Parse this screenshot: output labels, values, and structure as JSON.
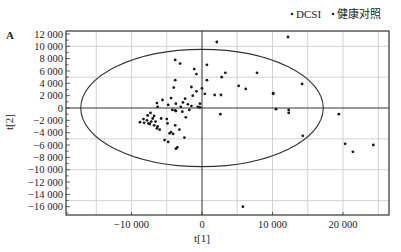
{
  "chart_data": {
    "type": "scatter",
    "panel_label": "A",
    "title": "",
    "xlabel": "t[1]",
    "ylabel": "t[2]",
    "xlim": [
      -19000,
      26500
    ],
    "ylim": [
      -17200,
      12500
    ],
    "x_ticks": [
      {
        "value": -10000,
        "label": "−10 000"
      },
      {
        "value": 0,
        "label": "0"
      },
      {
        "value": 10000,
        "label": "10 000"
      },
      {
        "value": 20000,
        "label": "20 000"
      }
    ],
    "y_ticks": [
      {
        "value": 12000,
        "label": "12 000"
      },
      {
        "value": 10000,
        "label": "10 000"
      },
      {
        "value": 8000,
        "label": "8 000"
      },
      {
        "value": 6000,
        "label": "6 000"
      },
      {
        "value": 4000,
        "label": "4 000"
      },
      {
        "value": 2000,
        "label": "2 000"
      },
      {
        "value": 0,
        "label": "0"
      },
      {
        "value": -2000,
        "label": "−2 000"
      },
      {
        "value": -4000,
        "label": "−4 000"
      },
      {
        "value": -6000,
        "label": "−6 000"
      },
      {
        "value": -8000,
        "label": "−8 000"
      },
      {
        "value": -10000,
        "label": "−10 000"
      },
      {
        "value": -12000,
        "label": "−12 000"
      },
      {
        "value": -14000,
        "label": "−14 000"
      },
      {
        "value": -16000,
        "label": "−16 000"
      }
    ],
    "grid": {
      "on": true,
      "x_step": 5000,
      "y_step": 5000
    },
    "legend": {
      "position": "top-right",
      "entries": [
        {
          "name": "DCSI",
          "marker": "dot"
        },
        {
          "name": "健康对照",
          "marker": "dot"
        }
      ]
    },
    "ellipse": {
      "label": "Hotelling T2 95%",
      "cx": 0,
      "cy": 0,
      "rx": 17200,
      "ry": 9500
    },
    "series": [
      {
        "name": "DCSI",
        "points": [
          [
            2100,
            10700
          ],
          [
            12200,
            11500
          ],
          [
            700,
            7000
          ],
          [
            3300,
            5700
          ],
          [
            7800,
            5700
          ],
          [
            700,
            4500
          ],
          [
            2800,
            5000
          ],
          [
            0,
            3200
          ],
          [
            5200,
            3600
          ],
          [
            6200,
            3100
          ],
          [
            10100,
            2400
          ],
          [
            14200,
            3900
          ],
          [
            400,
            2300
          ],
          [
            1800,
            2100
          ],
          [
            2700,
            2100
          ],
          [
            10100,
            2300
          ],
          [
            10500,
            -200
          ],
          [
            12300,
            -300
          ],
          [
            12300,
            -800
          ],
          [
            2600,
            -1000
          ],
          [
            19400,
            -1000
          ],
          [
            14300,
            -4500
          ],
          [
            20300,
            -5800
          ],
          [
            21400,
            -7100
          ],
          [
            24300,
            -6000
          ],
          [
            5800,
            -16000
          ]
        ]
      },
      {
        "name": "健康对照",
        "points": [
          [
            -3800,
            7800
          ],
          [
            -3100,
            7200
          ],
          [
            -1100,
            6300
          ],
          [
            -800,
            5500
          ],
          [
            -3800,
            4500
          ],
          [
            -4000,
            3300
          ],
          [
            -1500,
            3400
          ],
          [
            -2400,
            1500
          ],
          [
            -800,
            2700
          ],
          [
            -1300,
            2000
          ],
          [
            -2700,
            900
          ],
          [
            -3700,
            700
          ],
          [
            -4800,
            500
          ],
          [
            -2000,
            600
          ],
          [
            -1500,
            300
          ],
          [
            -3000,
            200
          ],
          [
            -600,
            200
          ],
          [
            -300,
            100
          ],
          [
            -4200,
            -300
          ],
          [
            -3700,
            -500
          ],
          [
            -6300,
            200
          ],
          [
            -7300,
            -800
          ],
          [
            -2800,
            -600
          ],
          [
            -1800,
            -300
          ],
          [
            -6400,
            800
          ],
          [
            -3800,
            -400
          ],
          [
            -5600,
            1300
          ],
          [
            -4400,
            1600
          ],
          [
            -300,
            700
          ],
          [
            -7700,
            -1200
          ],
          [
            -8300,
            -1800
          ],
          [
            -7800,
            -2000
          ],
          [
            -8800,
            -2300
          ],
          [
            -7200,
            -2200
          ],
          [
            -7400,
            -2600
          ],
          [
            -6800,
            -2800
          ],
          [
            -6600,
            -2200
          ],
          [
            -7000,
            -1700
          ],
          [
            -8200,
            -2400
          ],
          [
            -7600,
            -2500
          ],
          [
            -6300,
            -3000
          ],
          [
            -6000,
            -3500
          ],
          [
            -6400,
            -3300
          ],
          [
            -3800,
            -2800
          ],
          [
            -4600,
            -4100
          ],
          [
            -4100,
            -4200
          ],
          [
            -4400,
            -3900
          ],
          [
            -3700,
            -6600
          ],
          [
            -3500,
            -6400
          ],
          [
            -2500,
            -4800
          ],
          [
            -3200,
            -3500
          ],
          [
            -2300,
            -1500
          ],
          [
            -5000,
            -1800
          ],
          [
            -6800,
            -1300
          ],
          [
            -5800,
            -1700
          ],
          [
            -4900,
            -2500
          ],
          [
            -5300,
            -5200
          ],
          [
            -4800,
            -5500
          ]
        ]
      }
    ]
  }
}
